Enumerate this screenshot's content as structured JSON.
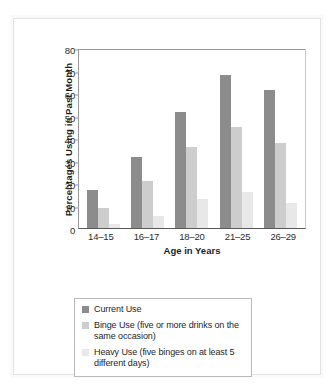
{
  "chart_data": {
    "type": "bar",
    "title": "",
    "xlabel": "Age in Years",
    "ylabel": "Percentages Using in Past Month",
    "ylim": [
      0,
      80
    ],
    "yticks": [
      0,
      10,
      20,
      30,
      40,
      50,
      60,
      70,
      80
    ],
    "ytick_labels": [
      "0",
      "10",
      "20",
      "30",
      "40",
      "50",
      "60",
      "70",
      "80"
    ],
    "grid": false,
    "legend_position": "below-plot",
    "categories": [
      "14–15",
      "16–17",
      "18–20",
      "21–25",
      "26–29"
    ],
    "series": [
      {
        "name": "Current Use",
        "legend_label": "Current Use",
        "color": "#8c8c8c",
        "values": [
          17,
          31.5,
          51.5,
          68,
          61.5
        ]
      },
      {
        "name": "Binge Use",
        "legend_label": "Binge Use (five or more drinks on the same occasion)",
        "color": "#cdcdcd",
        "values": [
          9,
          21,
          36,
          45,
          38
        ]
      },
      {
        "name": "Heavy Use",
        "legend_label": "Heavy Use (five binges on at least 5 different days)",
        "color": "#e8e8e8",
        "values": [
          2,
          5.5,
          13,
          16,
          11
        ]
      }
    ]
  },
  "axis": {
    "y_title": "Percentages Using in Past Month",
    "x_title": "Age in Years",
    "y_ticks": [
      "80",
      "70",
      "60",
      "50",
      "40",
      "30",
      "20",
      "10",
      "0"
    ],
    "x_ticks": [
      "14–15",
      "16–17",
      "18–20",
      "21–25",
      "26–29"
    ]
  },
  "legend": {
    "items": [
      {
        "label": "Current Use",
        "color": "#8c8c8c"
      },
      {
        "label": "Binge Use (five or more drinks on the same occasion)",
        "color": "#cdcdcd"
      },
      {
        "label": "Heavy Use (five binges on at least 5 different days)",
        "color": "#e8e8e8"
      }
    ]
  },
  "colors": {
    "series_current": "#8c8c8c",
    "series_binge": "#cdcdcd",
    "series_heavy": "#e8e8e8",
    "axis": "#5a5a5a",
    "text": "#1f1f1f",
    "background": "#ffffff"
  }
}
